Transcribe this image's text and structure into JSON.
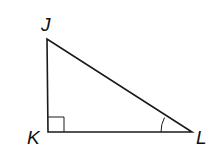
{
  "diagram": {
    "type": "right-triangle",
    "vertices": [
      {
        "name": "J",
        "label": "J",
        "x": 47,
        "y": 39
      },
      {
        "name": "K",
        "label": "K",
        "x": 48,
        "y": 132
      },
      {
        "name": "L",
        "label": "L",
        "x": 192,
        "y": 132
      }
    ],
    "right_angle_at": "K",
    "marked_angle_at": "L",
    "colors": {
      "stroke": "#1a1a1a",
      "background": "#ffffff"
    }
  }
}
